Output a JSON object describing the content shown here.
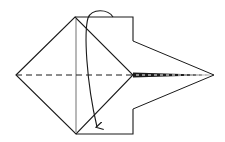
{
  "diagram": {
    "title": "Origami folding step",
    "colors": {
      "line": "#1a1a1a",
      "background": "#ffffff"
    },
    "elements": {
      "diamond": "left diamond flap",
      "rectangle": "central rectangular layer",
      "kite": "right kite point",
      "valley_fold": "dashed horizontal fold line",
      "arrow": "curved fold-down arrow"
    }
  }
}
